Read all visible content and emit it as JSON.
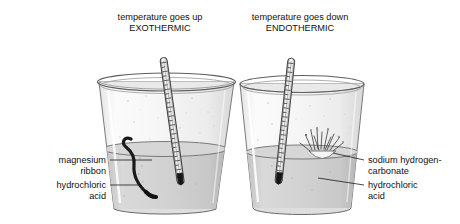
{
  "figure": {
    "title_hidden": "Exothermic and endothermic reaction beakers",
    "background_color": "#ffffff",
    "ink_color": "#1a1a1a",
    "glass_fill": "#f2f2f2",
    "liquid_fill": "#cfcfcf",
    "highlight_color": "#ffffff"
  },
  "panels": [
    {
      "id": "exothermic",
      "caption_line1": "temperature goes up",
      "caption_line2": "EXOTHERMIC",
      "caption_x": 160,
      "caption_y1": 20,
      "caption_y2": 31,
      "beaker": {
        "cx": 165,
        "rim_y": 82,
        "rim_rx": 69,
        "rim_ry": 9,
        "base_y": 209,
        "base_rx": 53,
        "base_ry": 7,
        "liquid_y": 149,
        "liquid_rx": 62,
        "liquid_ry": 7.5
      },
      "thermometer": {
        "top_x": 184,
        "top_y": 57,
        "bulb_x": 160,
        "bulb_y": 186,
        "graduation_count": 26
      },
      "substance": {
        "name": "magnesium-ribbon",
        "style": "curved-dark-ribbon"
      }
    },
    {
      "id": "endothermic",
      "caption_line1": "temperature goes down",
      "caption_y1": 20,
      "caption_line2": "ENDOTHERMIC",
      "caption_x": 300,
      "caption_y2": 31,
      "beaker": {
        "cx": 302,
        "rim_y": 84,
        "rim_rx": 62,
        "rim_ry": 8.5,
        "base_y": 208,
        "base_rx": 49,
        "base_ry": 6.5,
        "liquid_y": 152,
        "liquid_rx": 56,
        "liquid_ry": 7,
        "powder_mound_cx": 323,
        "powder_mound_cy": 152
      },
      "thermometer": {
        "top_x": 275,
        "top_y": 58,
        "bulb_x": 289,
        "bulb_y": 184,
        "graduation_count": 26
      },
      "substance": {
        "name": "sodium-hydrogencarbonate",
        "style": "white-powder-mound-with-fizz"
      }
    }
  ],
  "labels": {
    "left": [
      {
        "id": "magnesium-ribbon",
        "line1": "magnesium",
        "line2": "ribbon",
        "text_anchor_x": 106,
        "line1_y": 163,
        "line2_y": 174,
        "leader": {
          "x1": 110,
          "y1": 160,
          "x2": 152,
          "y2": 160
        }
      },
      {
        "id": "hydrochloric-acid-left",
        "line1": "hydrochloric",
        "line2": "acid",
        "text_anchor_x": 106,
        "line1_y": 188,
        "line2_y": 199,
        "leader": {
          "x1": 110,
          "y1": 185,
          "x2": 140,
          "y2": 185
        }
      }
    ],
    "right": [
      {
        "id": "sodium-hydrogencarbonate",
        "line1": "sodium hydrogen-",
        "line2": "carbonate",
        "text_anchor_x": 368,
        "line1_y": 163,
        "line2_y": 174,
        "leader": {
          "x1": 364,
          "y1": 160,
          "x2": 333,
          "y2": 153
        }
      },
      {
        "id": "hydrochloric-acid-right",
        "line1": "hydrochloric",
        "line2": "acid",
        "text_anchor_x": 368,
        "line1_y": 188,
        "line2_y": 199,
        "leader": {
          "x1": 364,
          "y1": 185,
          "x2": 318,
          "y2": 178
        }
      }
    ]
  }
}
